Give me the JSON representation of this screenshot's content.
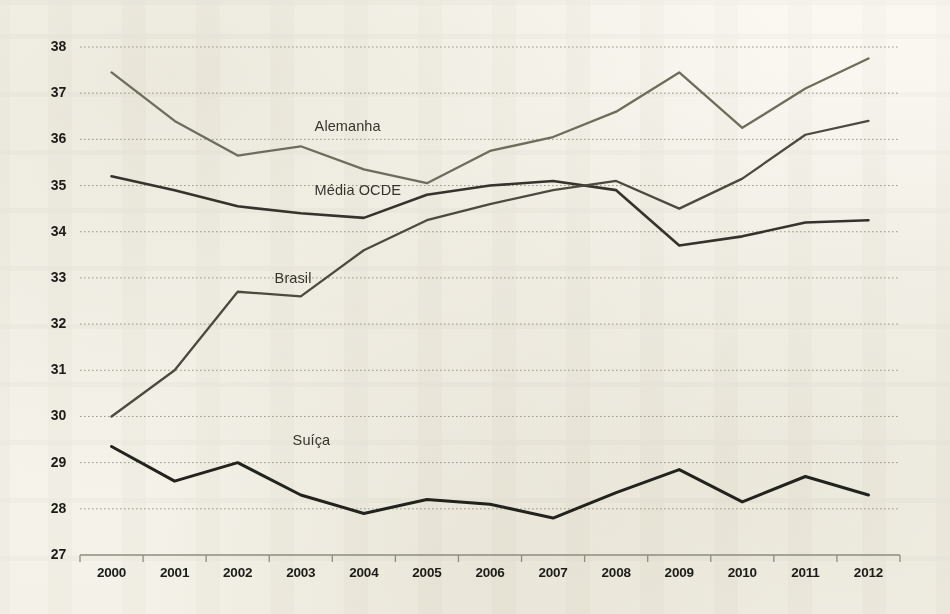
{
  "chart_data": {
    "type": "line",
    "title": "",
    "subtitle": "",
    "xlabel": "",
    "ylabel": "",
    "grid": true,
    "legend_position": "inline-labels",
    "x": [
      "2000",
      "2001",
      "2002",
      "2003",
      "2004",
      "2005",
      "2006",
      "2007",
      "2008",
      "2009",
      "2010",
      "2011",
      "2012"
    ],
    "categories": [
      "2000",
      "2001",
      "2002",
      "2003",
      "2004",
      "2005",
      "2006",
      "2007",
      "2008",
      "2009",
      "2010",
      "2011",
      "2012"
    ],
    "xlim": [
      "2000",
      "2012"
    ],
    "ylim": [
      27,
      38
    ],
    "yticks": [
      27,
      28,
      29,
      30,
      31,
      32,
      33,
      34,
      35,
      36,
      37,
      38
    ],
    "series": [
      {
        "name": "Alemanha",
        "color": "#6d6d5c",
        "values": [
          37.45,
          36.4,
          35.65,
          35.85,
          35.35,
          35.05,
          35.75,
          36.05,
          36.6,
          37.45,
          36.25,
          37.1,
          37.75
        ],
        "label_x": "2001",
        "label_y": 36.25
      },
      {
        "name": "Média OCDE",
        "color": "#34342c",
        "values": [
          35.2,
          34.9,
          34.55,
          34.4,
          34.3,
          34.8,
          35.0,
          35.1,
          34.9,
          33.7,
          33.9,
          34.2,
          34.25
        ],
        "label_x": "2001",
        "label_y": 34.85
      },
      {
        "name": "Brasil",
        "color": "#4a4a3f",
        "values": [
          30.0,
          31.0,
          32.7,
          32.6,
          33.6,
          34.25,
          34.6,
          34.9,
          35.1,
          34.5,
          35.15,
          36.1,
          36.4
        ],
        "label_x": "2001",
        "label_y": 32.95
      },
      {
        "name": "Suíça",
        "color": "#23231d",
        "values": [
          29.35,
          28.6,
          29.0,
          28.3,
          27.9,
          28.2,
          28.1,
          27.8,
          28.35,
          28.85,
          28.15,
          28.7,
          28.3
        ],
        "label_x": "2001",
        "label_y": 29.45
      }
    ],
    "axis_color": "#8d8d7c",
    "gridline_color": "#9a9a88",
    "background_color": "#f7f5ed",
    "tick_label_color": "#1c1c18"
  },
  "y_axis": {
    "ticks": [
      "38",
      "37",
      "36",
      "35",
      "34",
      "33",
      "32",
      "31",
      "30",
      "29",
      "28",
      "27"
    ]
  },
  "x_axis": {
    "ticks": [
      "2000",
      "2001",
      "2002",
      "2003",
      "2004",
      "2005",
      "2006",
      "2007",
      "2008",
      "2009",
      "2010",
      "2011",
      "2012"
    ]
  },
  "series_labels": [
    {
      "name": "Alemanha"
    },
    {
      "name": "Média OCDE"
    },
    {
      "name": "Brasil"
    },
    {
      "name": "Suíça"
    }
  ]
}
